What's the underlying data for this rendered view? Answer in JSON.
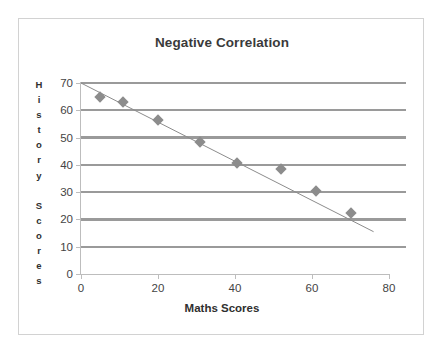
{
  "chart_data": {
    "type": "scatter",
    "title": "Negative Correlation",
    "xlabel": "Maths Scores",
    "ylabel": "History Scores",
    "xlim": [
      0,
      80
    ],
    "ylim": [
      0,
      70
    ],
    "xticks": [
      "0",
      "20",
      "40",
      "60",
      "80"
    ],
    "xtick_values": [
      0,
      20,
      40,
      60,
      80
    ],
    "yticks": [
      "0",
      "10",
      "20",
      "30",
      "40",
      "50",
      "60",
      "70"
    ],
    "ytick_values": [
      0,
      10,
      20,
      30,
      40,
      50,
      60,
      70
    ],
    "grid": "horizontal",
    "gridline_values": [
      10,
      20,
      30,
      40,
      50,
      60,
      70
    ],
    "legend": "none",
    "series": [
      {
        "name": "Scores",
        "marker": "diamond",
        "color": "#8c8c8c",
        "points": [
          {
            "x": 5,
            "y": 65
          },
          {
            "x": 11,
            "y": 63
          },
          {
            "x": 20,
            "y": 56.5
          },
          {
            "x": 31,
            "y": 48.5
          },
          {
            "x": 40.5,
            "y": 40.5
          },
          {
            "x": 52,
            "y": 38.5
          },
          {
            "x": 61,
            "y": 30.5
          },
          {
            "x": 70,
            "y": 22.5
          }
        ]
      }
    ],
    "trendline": {
      "name": "Line of best fit",
      "color": "#8c8c8c",
      "x_start": 0,
      "y_start": 70,
      "x_end": 76,
      "y_end": 15.5
    },
    "ylabel_letters": [
      "H",
      "i",
      "s",
      "t",
      "o",
      "r",
      "y",
      "",
      "S",
      "c",
      "o",
      "r",
      "e",
      "s"
    ]
  },
  "colors": {
    "marker": "#8c8c8c",
    "gridline": "#9a9a9a",
    "axis": "#bdbdbd",
    "frame": "#d2d2d2",
    "title_text": "#3a3a3a",
    "tick_text": "#444444"
  }
}
